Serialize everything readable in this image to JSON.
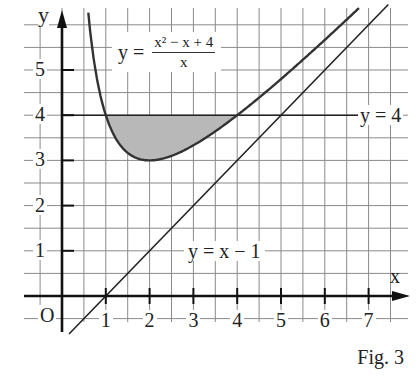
{
  "figure": {
    "caption": "Fig. 3",
    "axis_labels": {
      "x": "x",
      "y": "y",
      "origin": "O"
    },
    "labels": {
      "curve": {
        "lhs": "y =",
        "numerator": "x² − x + 4",
        "denominator": "x"
      },
      "horizontal_line": "y = 4",
      "line": "y = x − 1"
    }
  },
  "chart_data": {
    "type": "line",
    "title": "",
    "caption": "Fig. 3",
    "xlabel": "x",
    "ylabel": "y",
    "xlim": [
      -0.85,
      7.9
    ],
    "ylim": [
      -0.6,
      6.3
    ],
    "grid": true,
    "grid_step": 0.5,
    "x_ticks": [
      1,
      2,
      3,
      4,
      5,
      6,
      7
    ],
    "y_ticks": [
      1,
      2,
      3,
      4,
      5
    ],
    "origin_label": "O",
    "series": [
      {
        "name": "y = (x² − x + 4)/x",
        "expression": "(x^2 - x + 4)/x",
        "domain": [
          0.55,
          7.3
        ],
        "minimum": {
          "x": 2,
          "y": 3
        }
      },
      {
        "name": "y = 4",
        "expression": "4",
        "domain": [
          0,
          7.5
        ]
      },
      {
        "name": "y = x − 1",
        "expression": "x - 1",
        "domain": [
          0.2,
          7.5
        ]
      }
    ],
    "shaded_region": {
      "between": [
        "y = 4",
        "y = (x² − x + 4)/x"
      ],
      "x_range": [
        1,
        4
      ],
      "color": "#b8b8b8"
    },
    "intersections": [
      {
        "x": 1,
        "y": 4
      },
      {
        "x": 4,
        "y": 4
      },
      {
        "x": 5,
        "y": 4
      }
    ],
    "legend": null,
    "annotations": [
      "y = (x² − x + 4)/x",
      "y = 4",
      "y = x − 1"
    ]
  },
  "colors": {
    "grid": "#8a8a8a",
    "axis": "#111111",
    "curve": "#333333",
    "shade": "#b8b8b8"
  }
}
